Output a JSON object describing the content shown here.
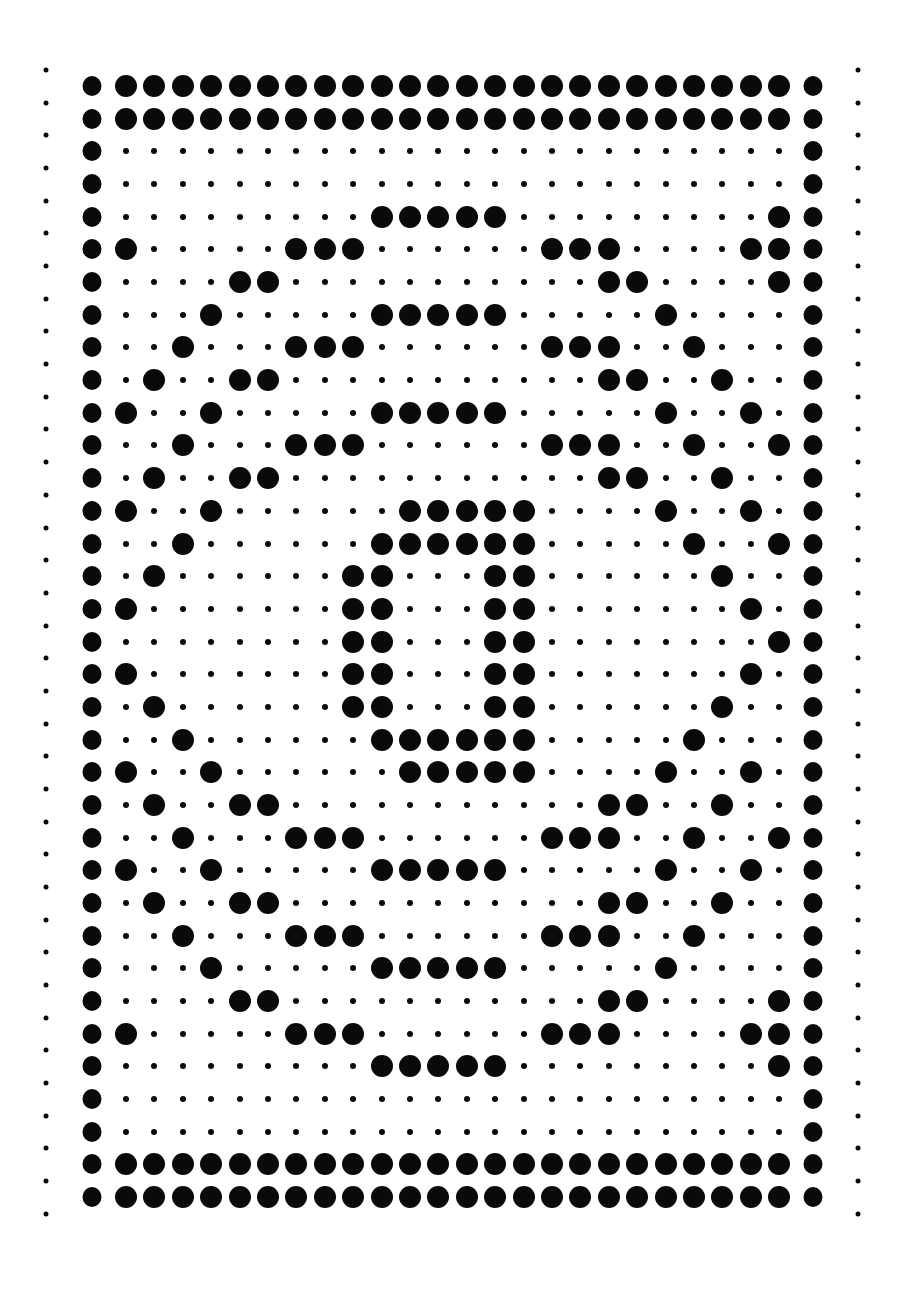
{
  "colors": {
    "dot": "#0a0a0a",
    "background": "#ffffff"
  },
  "grid": {
    "rows": 35,
    "interior_columns": 24,
    "border_columns": [
      "left",
      "right"
    ],
    "legend": {
      "1": "large dot",
      "0": "small dot"
    },
    "pattern": [
      "111111111111111111111111",
      "111111111111111111111111",
      "000000000000000000000000",
      "000000000000000000000000",
      "000000000111110000000001",
      "100000111000000111000011",
      "000011000000000001100001",
      "000100000111110000010000",
      "001000111000000111001000",
      "010011000000000001100100",
      "100100000111110000010010",
      "001000111000000111001001",
      "010011000000000001100100",
      "100100000011111000010010",
      "001000000111111000001001",
      "010000001100011000000100",
      "100000001100011000000010",
      "000000001100011000000001",
      "100000001100011000000010",
      "010000001100011000000100",
      "001000000111111000001000",
      "100100000011111000010010",
      "010011000000000001100100",
      "001000111000000111001001",
      "100100000111110000010010",
      "010011000000000001100100",
      "001000111000000111001000",
      "000100000111110000010000",
      "000011000000000001100001",
      "100000111000000111000011",
      "000000000111110000000001",
      "000000000000000000000000",
      "000000000000000000000000",
      "111111111111111111111111",
      "111111111111111111111111"
    ]
  },
  "edge_dots": {
    "count_per_side": 36
  }
}
